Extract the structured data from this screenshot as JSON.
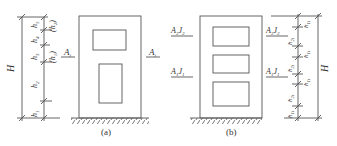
{
  "figure_a": {
    "caption": "(a)",
    "total_height_label": "H",
    "segments": [
      "h1",
      "h2",
      "h3",
      "h4",
      "h5"
    ],
    "segment_labels": {
      "h1": "h",
      "h2": "h",
      "h3": "h",
      "h4": "h",
      "h5": "h"
    },
    "segment_subs": {
      "h1": "1",
      "h2": "2",
      "h3": "3",
      "h4": "4",
      "h5": "5"
    },
    "paren_labels": [
      {
        "main": "h",
        "sub": "2"
      },
      {
        "main": "h",
        "sub": "1"
      }
    ],
    "section_left": {
      "main": "A",
      "sub": "i"
    },
    "section_right": {
      "main": "A",
      "sub": "i"
    }
  },
  "figure_b": {
    "caption": "(b)",
    "total_height_label": "H",
    "section_upper": {
      "a": "A",
      "a_sub": "2",
      "j": "J",
      "j_sub": "2"
    },
    "section_lower": {
      "a": "A",
      "a_sub": "1",
      "j": "J",
      "j_sub": "1"
    },
    "segments_left": [
      {
        "main": "h",
        "sub": "2i"
      },
      {
        "main": "h",
        "sub": "2i"
      },
      {
        "main": "h",
        "sub": "2i"
      }
    ],
    "segments_right": [
      {
        "main": "h",
        "sub": "1i"
      },
      {
        "main": "h",
        "sub": "1i"
      },
      {
        "main": "h",
        "sub": "1i"
      },
      {
        "main": "h",
        "sub": "1i"
      }
    ]
  },
  "colors": {
    "line": "#555555",
    "text": "#333333",
    "bg": "#ffffff"
  }
}
